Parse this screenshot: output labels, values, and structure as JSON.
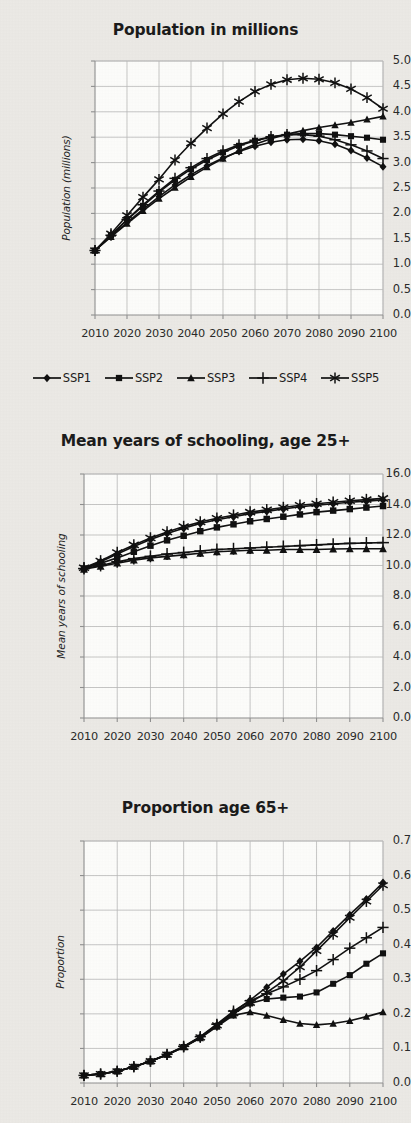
{
  "figure": {
    "background_color": "#eceae6",
    "ink_color": "#111111",
    "grid_color": "#b9b9b9",
    "axis_color": "#909090"
  },
  "legend": {
    "position": "below-chart-1",
    "entries": [
      {
        "label": "SSP1",
        "marker": "diamond"
      },
      {
        "label": "SSP2",
        "marker": "square"
      },
      {
        "label": "SSP3",
        "marker": "triangle"
      },
      {
        "label": "SSP4",
        "marker": "plus"
      },
      {
        "label": "SSP5",
        "marker": "asterisk"
      }
    ]
  },
  "chart_data": [
    {
      "id": "population",
      "type": "line",
      "title": "Population in millions",
      "xlabel": "",
      "ylabel": "Population (millions)",
      "x": [
        2010,
        2015,
        2020,
        2025,
        2030,
        2035,
        2040,
        2045,
        2050,
        2055,
        2060,
        2065,
        2070,
        2075,
        2080,
        2085,
        2090,
        2095,
        2100
      ],
      "xticks": [
        2010,
        2020,
        2030,
        2040,
        2050,
        2060,
        2070,
        2080,
        2090,
        2100
      ],
      "xlim": [
        2010,
        2100
      ],
      "ylim": [
        0.0,
        5.0
      ],
      "yticks": [
        0.0,
        0.5,
        1.0,
        1.5,
        2.0,
        2.5,
        3.0,
        3.5,
        4.0,
        4.5,
        5.0
      ],
      "ytick_labels": [
        "0.0",
        "0.5",
        "1.0",
        "1.5",
        "2.0",
        "2.5",
        "3.0",
        "3.5",
        "4.0",
        "4.5",
        "5.0"
      ],
      "grid": true,
      "series": [
        {
          "name": "SSP1",
          "marker": "diamond",
          "values": [
            1.27,
            1.55,
            1.82,
            2.08,
            2.33,
            2.56,
            2.76,
            2.94,
            3.09,
            3.22,
            3.32,
            3.4,
            3.45,
            3.46,
            3.43,
            3.36,
            3.24,
            3.09,
            2.92
          ]
        },
        {
          "name": "SSP2",
          "marker": "square",
          "values": [
            1.27,
            1.57,
            1.87,
            2.15,
            2.42,
            2.66,
            2.87,
            3.05,
            3.2,
            3.33,
            3.43,
            3.5,
            3.55,
            3.57,
            3.57,
            3.55,
            3.52,
            3.49,
            3.45
          ]
        },
        {
          "name": "SSP3",
          "marker": "triangle",
          "values": [
            1.27,
            1.54,
            1.8,
            2.05,
            2.29,
            2.51,
            2.72,
            2.91,
            3.08,
            3.23,
            3.36,
            3.47,
            3.56,
            3.63,
            3.69,
            3.74,
            3.79,
            3.85,
            3.91
          ]
        },
        {
          "name": "SSP4",
          "marker": "plus",
          "values": [
            1.27,
            1.57,
            1.88,
            2.17,
            2.44,
            2.69,
            2.9,
            3.08,
            3.23,
            3.35,
            3.44,
            3.51,
            3.55,
            3.55,
            3.52,
            3.45,
            3.35,
            3.23,
            3.08
          ]
        },
        {
          "name": "SSP5",
          "marker": "asterisk",
          "values": [
            1.27,
            1.6,
            1.96,
            2.32,
            2.67,
            3.05,
            3.38,
            3.68,
            3.96,
            4.2,
            4.4,
            4.54,
            4.63,
            4.66,
            4.64,
            4.57,
            4.45,
            4.28,
            4.06
          ]
        }
      ]
    },
    {
      "id": "schooling",
      "type": "line",
      "title": "Mean years of schooling, age 25+",
      "xlabel": "",
      "ylabel": "Mean years of schooling",
      "x": [
        2010,
        2015,
        2020,
        2025,
        2030,
        2035,
        2040,
        2045,
        2050,
        2055,
        2060,
        2065,
        2070,
        2075,
        2080,
        2085,
        2090,
        2095,
        2100
      ],
      "xticks": [
        2010,
        2020,
        2030,
        2040,
        2050,
        2060,
        2070,
        2080,
        2090,
        2100
      ],
      "xlim": [
        2010,
        2100
      ],
      "ylim": [
        0.0,
        16.0
      ],
      "yticks": [
        0.0,
        2.0,
        4.0,
        6.0,
        8.0,
        10.0,
        12.0,
        14.0,
        16.0
      ],
      "ytick_labels": [
        "0.0",
        "2.0",
        "4.0",
        "6.0",
        "8.0",
        "10.0",
        "12.0",
        "14.0",
        "16.0"
      ],
      "grid": true,
      "series": [
        {
          "name": "SSP1",
          "marker": "diamond",
          "values": [
            9.8,
            10.25,
            10.75,
            11.25,
            11.7,
            12.1,
            12.45,
            12.75,
            13.0,
            13.2,
            13.4,
            13.55,
            13.7,
            13.85,
            13.95,
            14.05,
            14.15,
            14.22,
            14.3
          ]
        },
        {
          "name": "SSP2",
          "marker": "square",
          "values": [
            9.8,
            10.15,
            10.5,
            10.9,
            11.3,
            11.65,
            11.95,
            12.25,
            12.5,
            12.7,
            12.9,
            13.05,
            13.2,
            13.35,
            13.5,
            13.6,
            13.7,
            13.8,
            13.9
          ]
        },
        {
          "name": "SSP3",
          "marker": "triangle",
          "values": [
            9.75,
            9.95,
            10.15,
            10.35,
            10.5,
            10.6,
            10.7,
            10.8,
            10.9,
            10.95,
            11.0,
            11.0,
            11.05,
            11.05,
            11.05,
            11.08,
            11.1,
            11.1,
            11.1
          ]
        },
        {
          "name": "SSP4",
          "marker": "plus",
          "values": [
            9.8,
            10.0,
            10.25,
            10.45,
            10.6,
            10.75,
            10.85,
            10.95,
            11.05,
            11.1,
            11.15,
            11.2,
            11.25,
            11.3,
            11.35,
            11.4,
            11.45,
            11.48,
            11.5
          ]
        },
        {
          "name": "SSP5",
          "marker": "asterisk",
          "values": [
            9.85,
            10.3,
            10.85,
            11.35,
            11.8,
            12.2,
            12.55,
            12.85,
            13.1,
            13.3,
            13.5,
            13.65,
            13.8,
            13.95,
            14.05,
            14.15,
            14.25,
            14.32,
            14.4
          ]
        }
      ]
    },
    {
      "id": "proportion65",
      "type": "line",
      "title": "Proportion age 65+",
      "xlabel": "",
      "ylabel": "Proportion",
      "x": [
        2010,
        2015,
        2020,
        2025,
        2030,
        2035,
        2040,
        2045,
        2050,
        2055,
        2060,
        2065,
        2070,
        2075,
        2080,
        2085,
        2090,
        2095,
        2100
      ],
      "xticks": [
        2010,
        2020,
        2030,
        2040,
        2050,
        2060,
        2070,
        2080,
        2090,
        2100
      ],
      "xlim": [
        2010,
        2100
      ],
      "ylim": [
        0.0,
        0.7
      ],
      "yticks": [
        0.0,
        0.1,
        0.2,
        0.3,
        0.4,
        0.5,
        0.6,
        0.7
      ],
      "ytick_labels": [
        "0.0",
        "0.1",
        "0.2",
        "0.3",
        "0.4",
        "0.5",
        "0.6",
        "0.7"
      ],
      "grid": true,
      "series": [
        {
          "name": "SSP1",
          "marker": "diamond",
          "values": [
            0.022,
            0.026,
            0.034,
            0.047,
            0.063,
            0.082,
            0.105,
            0.133,
            0.168,
            0.205,
            0.24,
            0.277,
            0.315,
            0.352,
            0.392,
            0.44,
            0.487,
            0.532,
            0.58
          ]
        },
        {
          "name": "SSP2",
          "marker": "square",
          "values": [
            0.022,
            0.026,
            0.034,
            0.047,
            0.063,
            0.082,
            0.104,
            0.131,
            0.165,
            0.2,
            0.23,
            0.243,
            0.247,
            0.25,
            0.262,
            0.287,
            0.312,
            0.345,
            0.375
          ]
        },
        {
          "name": "SSP3",
          "marker": "triangle",
          "values": [
            0.022,
            0.026,
            0.034,
            0.047,
            0.063,
            0.082,
            0.104,
            0.13,
            0.163,
            0.196,
            0.205,
            0.195,
            0.183,
            0.172,
            0.168,
            0.172,
            0.18,
            0.192,
            0.205
          ]
        },
        {
          "name": "SSP4",
          "marker": "plus",
          "values": [
            0.022,
            0.026,
            0.034,
            0.047,
            0.063,
            0.083,
            0.106,
            0.134,
            0.17,
            0.208,
            0.238,
            0.258,
            0.278,
            0.3,
            0.325,
            0.357,
            0.39,
            0.42,
            0.45
          ]
        },
        {
          "name": "SSP5",
          "marker": "asterisk",
          "values": [
            0.022,
            0.026,
            0.034,
            0.047,
            0.063,
            0.082,
            0.104,
            0.132,
            0.167,
            0.202,
            0.232,
            0.262,
            0.295,
            0.335,
            0.382,
            0.43,
            0.478,
            0.525,
            0.572
          ]
        }
      ]
    }
  ]
}
